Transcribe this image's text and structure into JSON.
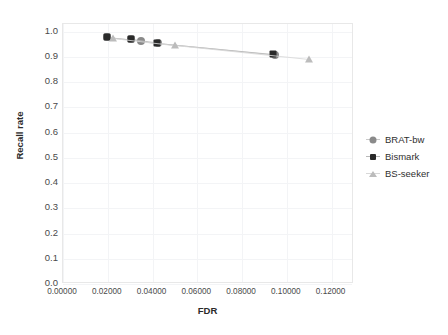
{
  "chart_data": {
    "type": "scatter",
    "title": "",
    "xlabel": "FDR",
    "ylabel": "Recall rate",
    "xlim": [
      0.0,
      0.13
    ],
    "ylim": [
      0.0,
      1.03
    ],
    "grid": true,
    "legend_position": "right",
    "x_ticks": [
      "0.00000",
      "0.02000",
      "0.04000",
      "0.06000",
      "0.08000",
      "0.10000",
      "0.12000"
    ],
    "x_tick_values": [
      0.0,
      0.02,
      0.04,
      0.06,
      0.08,
      0.1,
      0.12
    ],
    "y_ticks": [
      "0.0",
      "0.1",
      "0.2",
      "0.3",
      "0.4",
      "0.5",
      "0.6",
      "0.7",
      "0.8",
      "0.9",
      "1.0"
    ],
    "y_tick_values": [
      0.0,
      0.1,
      0.2,
      0.3,
      0.4,
      0.5,
      0.6,
      0.7,
      0.8,
      0.9,
      1.0
    ],
    "series": [
      {
        "name": "BRAT-bw",
        "marker": "circle",
        "color": "#8a8a8a",
        "line_color": "#c9c9c9",
        "points": [
          {
            "x": 0.0198,
            "y": 0.979
          },
          {
            "x": 0.0305,
            "y": 0.969
          },
          {
            "x": 0.035,
            "y": 0.964
          },
          {
            "x": 0.0425,
            "y": 0.955
          },
          {
            "x": 0.0945,
            "y": 0.909
          }
        ]
      },
      {
        "name": "Bismark",
        "marker": "square",
        "color": "#2a2a2a",
        "line_color": "#b8b8b8",
        "points": [
          {
            "x": 0.0196,
            "y": 0.98
          },
          {
            "x": 0.0302,
            "y": 0.97
          },
          {
            "x": 0.0421,
            "y": 0.956
          },
          {
            "x": 0.0938,
            "y": 0.912
          }
        ]
      },
      {
        "name": "BS-seeker",
        "marker": "triangle",
        "color": "#bcbcbc",
        "line_color": "#d8d8d8",
        "points": [
          {
            "x": 0.0222,
            "y": 0.976
          },
          {
            "x": 0.0502,
            "y": 0.947
          },
          {
            "x": 0.11,
            "y": 0.892
          }
        ]
      }
    ]
  },
  "legend": {
    "entries": [
      {
        "label": "BRAT-bw",
        "icon": "circle-marker-icon"
      },
      {
        "label": "Bismark",
        "icon": "square-marker-icon"
      },
      {
        "label": "BS-seeker",
        "icon": "triangle-marker-icon"
      }
    ]
  },
  "colors": {
    "brat_bw": "#8a8a8a",
    "bismark": "#2a2a2a",
    "bs_seeker": "#bcbcbc",
    "grid": "#f3f4f6",
    "frame": "#e8e8e8",
    "text": "#3b3b3b"
  }
}
